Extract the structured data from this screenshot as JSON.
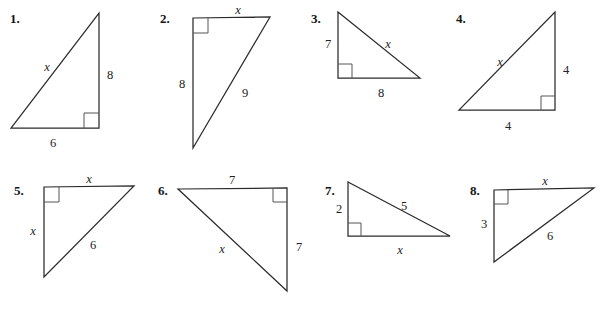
{
  "worksheet": {
    "title": "Right triangle worksheet",
    "description": "Eight right triangles with labeled legs, hypotenuses and unknown side x",
    "stroke_color": "#2b2b2b",
    "right_angle_color": "#555555",
    "background_color": "#ffffff",
    "text_color": "#222222"
  },
  "problems": [
    {
      "number": "1.",
      "number_pos": {
        "x": 10,
        "y": 12
      },
      "vertices": [
        [
          99,
          13
        ],
        [
          99,
          128
        ],
        [
          11,
          128
        ]
      ],
      "right_angle": {
        "at": [
          99,
          128
        ],
        "from": [
          99,
          113
        ],
        "to": [
          84,
          128
        ]
      },
      "labels": [
        {
          "text": "x",
          "italic": true,
          "x": 47,
          "y": 67
        },
        {
          "text": "8",
          "italic": false,
          "x": 110,
          "y": 75
        },
        {
          "text": "6",
          "italic": false,
          "x": 53,
          "y": 143
        }
      ]
    },
    {
      "number": "2.",
      "number_pos": {
        "x": 160,
        "y": 12
      },
      "vertices": [
        [
          193,
          18
        ],
        [
          270,
          17
        ],
        [
          193,
          148
        ]
      ],
      "right_angle": {
        "at": [
          193,
          18
        ],
        "from": [
          208,
          18
        ],
        "to": [
          193,
          33
        ]
      },
      "labels": [
        {
          "text": "x",
          "italic": true,
          "x": 238,
          "y": 10
        },
        {
          "text": "8",
          "italic": false,
          "x": 182,
          "y": 84
        },
        {
          "text": "9",
          "italic": false,
          "x": 245,
          "y": 93
        }
      ]
    },
    {
      "number": "3.",
      "number_pos": {
        "x": 311,
        "y": 12
      },
      "vertices": [
        [
          338,
          12
        ],
        [
          420,
          78
        ],
        [
          338,
          78
        ]
      ],
      "right_angle": {
        "at": [
          338,
          78
        ],
        "from": [
          338,
          64
        ],
        "to": [
          352,
          78
        ]
      },
      "labels": [
        {
          "text": "7",
          "italic": false,
          "x": 328,
          "y": 44
        },
        {
          "text": "x",
          "italic": true,
          "x": 388,
          "y": 44
        },
        {
          "text": "8",
          "italic": false,
          "x": 381,
          "y": 93
        }
      ]
    },
    {
      "number": "4.",
      "number_pos": {
        "x": 456,
        "y": 12
      },
      "vertices": [
        [
          555,
          12
        ],
        [
          555,
          110
        ],
        [
          459,
          110
        ]
      ],
      "right_angle": {
        "at": [
          555,
          110
        ],
        "from": [
          555,
          96
        ],
        "to": [
          541,
          110
        ]
      },
      "labels": [
        {
          "text": "x",
          "italic": true,
          "x": 500,
          "y": 62
        },
        {
          "text": "4",
          "italic": false,
          "x": 566,
          "y": 70
        },
        {
          "text": "4",
          "italic": false,
          "x": 508,
          "y": 126
        }
      ]
    },
    {
      "number": "5.",
      "number_pos": {
        "x": 14,
        "y": 184
      },
      "vertices": [
        [
          44,
          187
        ],
        [
          134,
          186
        ],
        [
          44,
          277
        ]
      ],
      "right_angle": {
        "at": [
          44,
          187
        ],
        "from": [
          59,
          187
        ],
        "to": [
          44,
          202
        ]
      },
      "labels": [
        {
          "text": "x",
          "italic": true,
          "x": 89,
          "y": 179
        },
        {
          "text": "x",
          "italic": true,
          "x": 33,
          "y": 231
        },
        {
          "text": "6",
          "italic": false,
          "x": 93,
          "y": 245
        }
      ]
    },
    {
      "number": "6.",
      "number_pos": {
        "x": 158,
        "y": 184
      },
      "vertices": [
        [
          178,
          189
        ],
        [
          287,
          188
        ],
        [
          287,
          291
        ]
      ],
      "right_angle": {
        "at": [
          287,
          188
        ],
        "from": [
          273,
          188
        ],
        "to": [
          287,
          202
        ]
      },
      "labels": [
        {
          "text": "7",
          "italic": false,
          "x": 232,
          "y": 180
        },
        {
          "text": "7",
          "italic": false,
          "x": 299,
          "y": 247
        },
        {
          "text": "x",
          "italic": true,
          "x": 222,
          "y": 249
        }
      ]
    },
    {
      "number": "7.",
      "number_pos": {
        "x": 325,
        "y": 184
      },
      "vertices": [
        [
          348,
          182
        ],
        [
          450,
          236
        ],
        [
          348,
          236
        ]
      ],
      "right_angle": {
        "at": [
          348,
          236
        ],
        "from": [
          348,
          223
        ],
        "to": [
          361,
          236
        ]
      },
      "labels": [
        {
          "text": "2",
          "italic": false,
          "x": 339,
          "y": 209
        },
        {
          "text": "5",
          "italic": false,
          "x": 404,
          "y": 206
        },
        {
          "text": "x",
          "italic": true,
          "x": 400,
          "y": 250
        }
      ]
    },
    {
      "number": "8.",
      "number_pos": {
        "x": 470,
        "y": 184
      },
      "vertices": [
        [
          494,
          190
        ],
        [
          594,
          188
        ],
        [
          494,
          262
        ]
      ],
      "right_angle": {
        "at": [
          494,
          190
        ],
        "from": [
          508,
          190
        ],
        "to": [
          494,
          204
        ]
      },
      "labels": [
        {
          "text": "x",
          "italic": true,
          "x": 545,
          "y": 181
        },
        {
          "text": "3",
          "italic": false,
          "x": 484,
          "y": 224
        },
        {
          "text": "6",
          "italic": false,
          "x": 550,
          "y": 236
        }
      ]
    }
  ]
}
